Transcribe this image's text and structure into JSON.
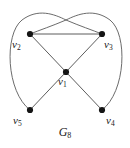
{
  "figure": {
    "caption_base": "G",
    "caption_sub": "8",
    "caption_full": "G8",
    "background_color": "#ffffff",
    "edge_color": "#4a4a4a",
    "vertex_color": "#151515",
    "label_color": "#1a1a1a"
  },
  "graph": {
    "vertices": [
      {
        "id": "v1",
        "base": "v",
        "sub": "1",
        "label": "v1",
        "x": 66,
        "y": 72,
        "r": 3.1,
        "label_x": 58,
        "label_y": 76
      },
      {
        "id": "v2",
        "base": "v",
        "sub": "2",
        "label": "v2",
        "x": 30,
        "y": 34,
        "r": 3.1,
        "label_x": 12,
        "label_y": 39
      },
      {
        "id": "v3",
        "base": "v",
        "sub": "3",
        "label": "v3",
        "x": 102,
        "y": 34,
        "r": 3.1,
        "label_x": 104,
        "label_y": 39
      },
      {
        "id": "v4",
        "base": "v",
        "sub": "4",
        "label": "v4",
        "x": 102,
        "y": 110,
        "r": 3.1,
        "label_x": 106,
        "label_y": 115
      },
      {
        "id": "v5",
        "base": "v",
        "sub": "5",
        "label": "v5",
        "x": 30,
        "y": 110,
        "r": 3.1,
        "label_x": 13,
        "label_y": 115
      }
    ],
    "straight_edges": [
      {
        "from": "v2",
        "to": "v3",
        "path": "M 30 34 L 102 34"
      },
      {
        "from": "v2",
        "to": "v1",
        "path": "M 30 34 L 66 72"
      },
      {
        "from": "v3",
        "to": "v1",
        "path": "M 102 34 L 66 72"
      },
      {
        "from": "v1",
        "to": "v5",
        "path": "M 66 72 L 30 110"
      },
      {
        "from": "v1",
        "to": "v4",
        "path": "M 66 72 L 102 110"
      }
    ],
    "curved_edges": [
      {
        "from": "v5",
        "to": "v3",
        "path": "M 30 110 C 6 92 4 34 22 20 C 38 8 54 14 66 20 C 80 26 92 30 102 34"
      },
      {
        "from": "v4",
        "to": "v2",
        "path": "M 102 110 C 126 92 128 34 110 20 C 94 8 78 14 66 20 C 52 26 40 30 30 34"
      }
    ]
  }
}
